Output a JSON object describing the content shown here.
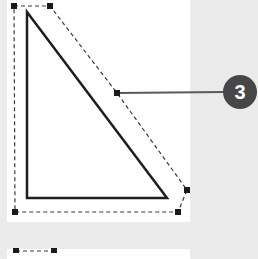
{
  "figure": {
    "colors": {
      "background": "#ebebeb",
      "canvas": "#ffffff",
      "shape_stroke": "#1e1e1e",
      "selection_dash": "#3a3a3a",
      "handle_fill": "#1a1a1a",
      "callout_line": "#5a5a5a",
      "callout_badge": "#474747",
      "callout_text": "#ffffff"
    },
    "callout": {
      "number": "3"
    },
    "triangle": {
      "points": "27,12 27,198 167,198"
    },
    "selection_outline": {
      "points": "14,6 50,6 117,93 187,190 178,212 15,212"
    },
    "handles": [
      {
        "x": 14,
        "y": 6
      },
      {
        "x": 50,
        "y": 6
      },
      {
        "x": 117,
        "y": 93
      },
      {
        "x": 187,
        "y": 190
      },
      {
        "x": 178,
        "y": 212
      },
      {
        "x": 15,
        "y": 212
      },
      {
        "x": 16,
        "y": 251
      },
      {
        "x": 54,
        "y": 251
      }
    ]
  }
}
